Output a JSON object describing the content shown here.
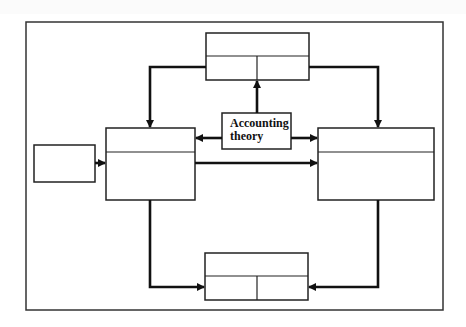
{
  "diagram": {
    "type": "flow-diagram",
    "frame": {
      "x": 26,
      "y": 22,
      "width": 417,
      "height": 288
    },
    "center_box": {
      "label_line1": "Accounting",
      "label_line2": "theory"
    },
    "boxes": [
      {
        "id": "input-box",
        "label": ""
      },
      {
        "id": "left-box",
        "label": ""
      },
      {
        "id": "top-box",
        "label": ""
      },
      {
        "id": "right-box",
        "label": ""
      },
      {
        "id": "bottom-box",
        "label": ""
      },
      {
        "id": "accounting-theory-box",
        "label": "Accounting theory"
      }
    ],
    "edges": [
      {
        "from": "input-box",
        "to": "left-box"
      },
      {
        "from": "accounting-theory-box",
        "to": "left-box"
      },
      {
        "from": "accounting-theory-box",
        "to": "right-box"
      },
      {
        "from": "accounting-theory-box",
        "to": "top-box"
      },
      {
        "from": "left-box",
        "to": "right-box"
      },
      {
        "from": "top-box",
        "to": "left-box"
      },
      {
        "from": "top-box",
        "to": "right-box"
      },
      {
        "from": "left-box",
        "to": "bottom-box"
      },
      {
        "from": "right-box",
        "to": "bottom-box"
      }
    ],
    "colors": {
      "line": "#1a1a1a",
      "background": "#ffffff"
    }
  }
}
